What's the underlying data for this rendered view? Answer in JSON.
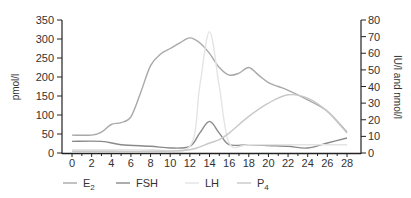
{
  "chart_data": {
    "type": "line",
    "title": "",
    "xlabel": "",
    "ylabel_left": "pmol/l",
    "ylabel_right": "IU/l and nmol/l",
    "xlim": [
      0,
      28
    ],
    "ylim_left": [
      0,
      350
    ],
    "ylim_right": [
      0,
      80
    ],
    "x_ticks": [
      0,
      2,
      4,
      6,
      8,
      10,
      12,
      14,
      16,
      18,
      20,
      22,
      24,
      26,
      28
    ],
    "y_ticks_left": [
      0,
      50,
      100,
      150,
      200,
      250,
      300,
      350
    ],
    "y_ticks_right": [
      0,
      10,
      20,
      30,
      40,
      50,
      60,
      70,
      80
    ],
    "grid": false,
    "legend_position": "bottom",
    "series": [
      {
        "name": "E2",
        "label_main": "E",
        "label_sub": "2",
        "axis": "left",
        "color": "#a8a8a8",
        "x": [
          0,
          2,
          3,
          4,
          5,
          6,
          7,
          8,
          9,
          10,
          11,
          12,
          13,
          14,
          15,
          16,
          17,
          18,
          19,
          20,
          21,
          22,
          24,
          26,
          28
        ],
        "y": [
          47,
          47,
          55,
          75,
          80,
          95,
          160,
          230,
          260,
          275,
          290,
          303,
          290,
          262,
          225,
          205,
          210,
          225,
          205,
          185,
          175,
          165,
          140,
          110,
          55
        ]
      },
      {
        "name": "FSH",
        "label_main": "FSH",
        "label_sub": "",
        "axis": "right",
        "color": "#8a8a8a",
        "x": [
          0,
          3,
          5,
          8,
          10,
          12,
          13,
          14,
          15,
          16,
          18,
          20,
          22,
          24,
          26,
          28
        ],
        "y": [
          7,
          7,
          5,
          4,
          3,
          4,
          12,
          19,
          12,
          5,
          5,
          4.5,
          4,
          3,
          6,
          9
        ]
      },
      {
        "name": "LH",
        "label_main": "LH",
        "label_sub": "",
        "axis": "right",
        "color": "#e4e4e4",
        "x": [
          0,
          4,
          8,
          12,
          13,
          14,
          15,
          16,
          18,
          22,
          28
        ],
        "y": [
          2,
          2,
          2,
          4,
          40,
          73,
          40,
          6,
          5,
          5,
          5
        ]
      },
      {
        "name": "P4",
        "label_main": "P",
        "label_sub": "4",
        "axis": "right",
        "color": "#c8c8c8",
        "x": [
          0,
          4,
          8,
          12,
          14,
          15,
          16,
          18,
          20,
          22,
          24,
          26,
          28
        ],
        "y": [
          1,
          1,
          1,
          2,
          6,
          8,
          12,
          22,
          30,
          35,
          33,
          25,
          12
        ]
      }
    ]
  },
  "legend": {
    "items": [
      {
        "main": "E",
        "sub": "2"
      },
      {
        "main": "FSH",
        "sub": ""
      },
      {
        "main": "LH",
        "sub": ""
      },
      {
        "main": "P",
        "sub": "4"
      }
    ]
  },
  "axes": {
    "left_label": "pmol/l",
    "right_label": "IU/l and nmol/l"
  }
}
